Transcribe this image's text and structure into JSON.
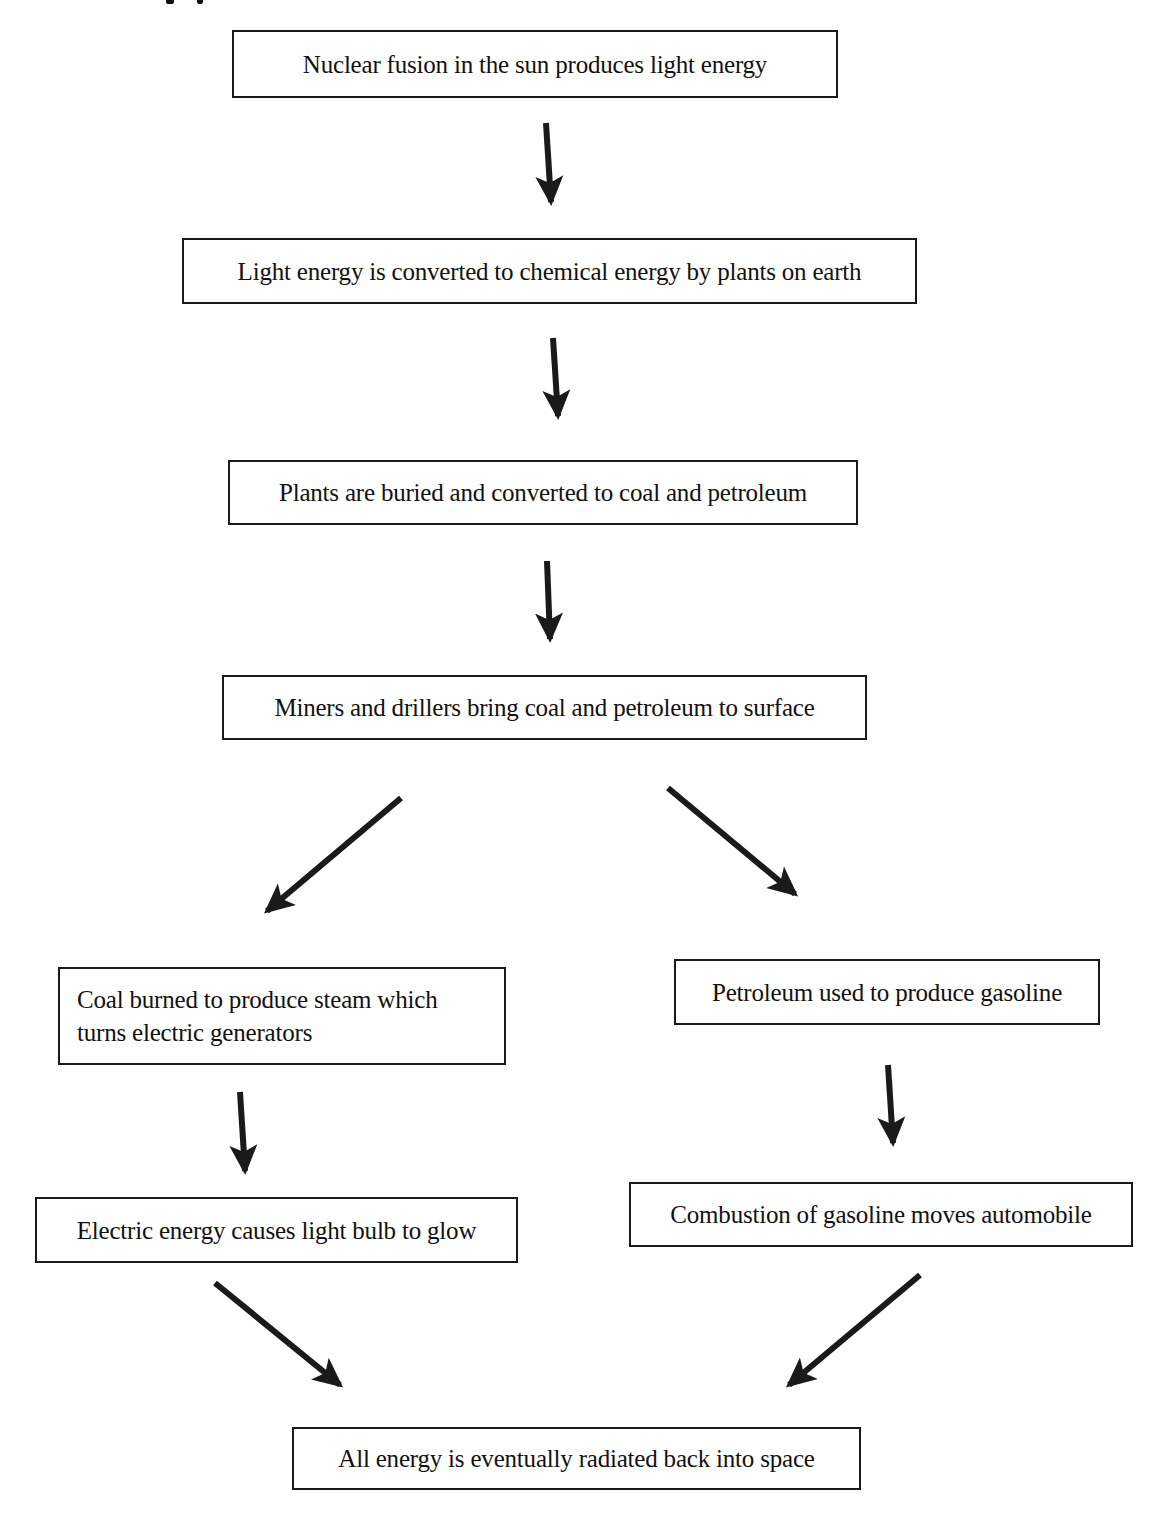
{
  "diagram": {
    "type": "flowchart",
    "colors": {
      "background": "#ffffff",
      "stroke": "#1a1a1a",
      "text": "#111111"
    },
    "nodes": [
      {
        "id": "n1",
        "label": "Nuclear fusion in the sun produces light energy"
      },
      {
        "id": "n2",
        "label": "Light energy is converted to chemical energy by plants on earth"
      },
      {
        "id": "n3",
        "label": "Plants are buried and converted to coal and petroleum"
      },
      {
        "id": "n4",
        "label": "Miners and drillers bring coal and petroleum to surface"
      },
      {
        "id": "n5a",
        "label": "Coal burned to produce steam which turns electric generators"
      },
      {
        "id": "n5b",
        "label": "Petroleum used to produce gasoline"
      },
      {
        "id": "n6a",
        "label": "Electric energy causes light bulb to glow"
      },
      {
        "id": "n6b",
        "label": "Combustion of gasoline moves automobile"
      },
      {
        "id": "n7",
        "label": "All energy is eventually radiated back into space"
      }
    ],
    "edges": [
      {
        "from": "n1",
        "to": "n2"
      },
      {
        "from": "n2",
        "to": "n3"
      },
      {
        "from": "n3",
        "to": "n4"
      },
      {
        "from": "n4",
        "to": "n5a"
      },
      {
        "from": "n4",
        "to": "n5b"
      },
      {
        "from": "n5a",
        "to": "n6a"
      },
      {
        "from": "n5b",
        "to": "n6b"
      },
      {
        "from": "n6a",
        "to": "n7"
      },
      {
        "from": "n6b",
        "to": "n7"
      }
    ]
  }
}
